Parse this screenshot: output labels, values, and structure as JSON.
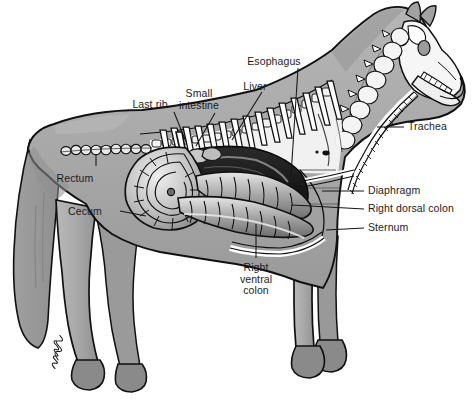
{
  "figure": {
    "view": "right lateral",
    "style": "grayscale line drawing with halftone shading",
    "background_color": "#ffffff",
    "signature": "artist signature (cursive, illegible)"
  },
  "palette": {
    "background": "#ffffff",
    "body_fill": "#a9a9a9",
    "body_fill_dark": "#8d8d8d",
    "body_fill_light": "#bdbdbd",
    "cavity_fill": "#f2f2f2",
    "bone_fill": "#f6f6f6",
    "hoof_fill": "#8a8a8a",
    "organ_dark": "#1f1f1f",
    "organ_mid": "#6e6e6e",
    "organ_light": "#d8d8d8",
    "outline": "#101010",
    "label_text": "#1b1b1b",
    "leader_line": "#151515"
  },
  "labels": [
    {
      "id": "last-rib",
      "text": "Last rib",
      "lines": [
        "Last rib"
      ],
      "align": "center",
      "x": 150,
      "y": 99,
      "leader": [
        [
          174,
          112
        ],
        [
          186,
          142
        ]
      ]
    },
    {
      "id": "small-intestine",
      "text": "Small intestine",
      "lines": [
        "Small",
        "intestine"
      ],
      "align": "center",
      "x": 199,
      "y": 88,
      "leader": [
        [
          215,
          113
        ],
        [
          196,
          146
        ]
      ]
    },
    {
      "id": "liver",
      "text": "Liver",
      "lines": [
        "Liver"
      ],
      "align": "center",
      "x": 255,
      "y": 81,
      "leader": [
        [
          262,
          92
        ],
        [
          232,
          140
        ]
      ]
    },
    {
      "id": "esophagus",
      "text": "Esophagus",
      "lines": [
        "Esophagus"
      ],
      "align": "center",
      "x": 274,
      "y": 56,
      "leader": [
        [
          298,
          68
        ],
        [
          291,
          172
        ]
      ]
    },
    {
      "id": "trachea",
      "text": "Trachea",
      "lines": [
        "Trachea"
      ],
      "align": "left",
      "x": 408,
      "y": 121,
      "leader": [
        [
          404,
          127
        ],
        [
          377,
          127
        ]
      ]
    },
    {
      "id": "diaphragm",
      "text": "Diaphragm",
      "lines": [
        "Diaphragm"
      ],
      "align": "left",
      "x": 368,
      "y": 185,
      "leader": [
        [
          364,
          191
        ],
        [
          325,
          191
        ]
      ]
    },
    {
      "id": "right-dorsal-colon",
      "text": "Right dorsal colon",
      "lines": [
        "Right dorsal colon"
      ],
      "align": "left",
      "x": 368,
      "y": 203,
      "leader": [
        [
          364,
          209
        ],
        [
          292,
          205
        ]
      ]
    },
    {
      "id": "sternum",
      "text": "Sternum",
      "lines": [
        "Sternum"
      ],
      "align": "left",
      "x": 368,
      "y": 222,
      "leader": [
        [
          364,
          228
        ],
        [
          328,
          228
        ]
      ]
    },
    {
      "id": "rectum",
      "text": "Rectum",
      "lines": [
        "Rectum"
      ],
      "align": "center",
      "x": 75,
      "y": 173,
      "leader": [
        [
          96,
          166
        ],
        [
          96,
          152
        ]
      ]
    },
    {
      "id": "cecum",
      "text": "Cecum",
      "lines": [
        "Cecum"
      ],
      "align": "center",
      "x": 85,
      "y": 206,
      "leader": [
        [
          120,
          211
        ],
        [
          148,
          216
        ]
      ]
    },
    {
      "id": "right-ventral-colon",
      "text": "Right ventral colon",
      "lines": [
        "Right",
        "ventral",
        "colon"
      ],
      "align": "center",
      "x": 235,
      "y": 262,
      "leader": [
        [
          256,
          258
        ],
        [
          256,
          222
        ]
      ]
    }
  ],
  "structures": [
    {
      "id": "skull",
      "name": "skull"
    },
    {
      "id": "mandible",
      "name": "mandible with teeth"
    },
    {
      "id": "cervical-vertebrae",
      "name": "cervical vertebrae"
    },
    {
      "id": "thoracic-spine",
      "name": "thoracic vertebrae"
    },
    {
      "id": "ribs",
      "name": "rib cage"
    },
    {
      "id": "sternum-bone",
      "name": "sternum"
    },
    {
      "id": "trachea-tube",
      "name": "trachea"
    },
    {
      "id": "esophagus-tube",
      "name": "esophagus"
    },
    {
      "id": "liver-mass",
      "name": "liver"
    },
    {
      "id": "small-intestine-mass",
      "name": "small intestine"
    },
    {
      "id": "cecum-coil",
      "name": "cecum"
    },
    {
      "id": "dorsal-colon",
      "name": "right dorsal colon"
    },
    {
      "id": "ventral-colon",
      "name": "right ventral colon"
    },
    {
      "id": "rectum-tube",
      "name": "rectum"
    },
    {
      "id": "diaphragm-line",
      "name": "diaphragm"
    }
  ]
}
